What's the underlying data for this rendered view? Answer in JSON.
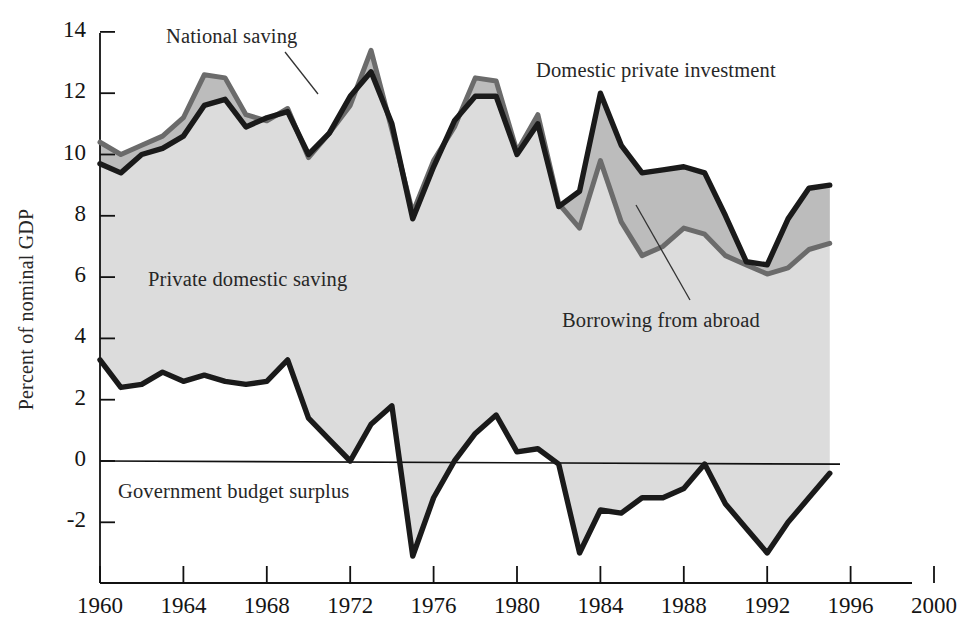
{
  "chart_data": {
    "type": "area",
    "title": "",
    "xlabel": "",
    "ylabel": "Percent of nominal GDP",
    "xlim": [
      1960,
      2000
    ],
    "ylim": [
      -3.6,
      14
    ],
    "grid": false,
    "legend_position": "inline-annotations",
    "x_ticks": [
      "1960",
      "1964",
      "1968",
      "1972",
      "1976",
      "1980",
      "1984",
      "1988",
      "1992",
      "1996",
      "2000"
    ],
    "y_ticks": [
      "14",
      "12",
      "10",
      "8",
      "6",
      "4",
      "2",
      "0",
      "-2"
    ],
    "x": [
      1960,
      1961,
      1962,
      1963,
      1964,
      1965,
      1966,
      1967,
      1968,
      1969,
      1970,
      1971,
      1972,
      1973,
      1974,
      1975,
      1976,
      1977,
      1978,
      1979,
      1980,
      1981,
      1982,
      1983,
      1984,
      1985,
      1986,
      1987,
      1988,
      1989,
      1990,
      1991,
      1992,
      1993,
      1994,
      1995
    ],
    "series": [
      {
        "name": "Domestic private investment",
        "color": "#1a1a1a",
        "values": [
          9.7,
          9.4,
          10.0,
          10.2,
          10.6,
          11.6,
          11.8,
          10.9,
          11.2,
          11.4,
          10.0,
          10.7,
          11.9,
          12.7,
          11.0,
          7.9,
          9.6,
          11.1,
          11.9,
          11.9,
          10.0,
          11.0,
          8.3,
          8.8,
          12.0,
          10.3,
          9.4,
          9.5,
          9.6,
          9.4,
          8.0,
          6.5,
          6.4,
          7.9,
          8.9,
          9.0
        ]
      },
      {
        "name": "National saving",
        "color": "#6b6b6b",
        "values": [
          10.4,
          10.0,
          10.3,
          10.6,
          11.2,
          12.6,
          12.5,
          11.3,
          11.1,
          11.5,
          9.9,
          10.7,
          11.6,
          13.4,
          10.8,
          8.1,
          9.8,
          10.9,
          12.5,
          12.4,
          10.1,
          11.3,
          8.4,
          7.6,
          9.8,
          7.8,
          6.7,
          7.0,
          7.6,
          7.4,
          6.7,
          6.4,
          6.1,
          6.3,
          6.9,
          7.1
        ]
      },
      {
        "name": "Government budget surplus",
        "color": "#1a1a1a",
        "values": [
          3.3,
          2.4,
          2.5,
          2.9,
          2.6,
          2.8,
          2.6,
          2.5,
          2.6,
          3.3,
          1.4,
          0.7,
          0.0,
          1.2,
          1.8,
          -3.1,
          -1.2,
          0.0,
          0.9,
          1.5,
          0.3,
          0.4,
          -0.1,
          -3.0,
          -1.6,
          -1.7,
          -1.2,
          -1.2,
          -0.9,
          -0.1,
          -1.4,
          -2.2,
          -3.0,
          -2.0,
          -1.2,
          -0.4
        ]
      }
    ],
    "bands": [
      {
        "name": "Private domestic saving",
        "fill": "#dcdcdc",
        "between": [
          "Government budget surplus",
          "Domestic private investment"
        ]
      },
      {
        "name": "Borrowing from abroad",
        "fill": "#bcbcbc",
        "between": [
          "National saving",
          "Domestic private investment"
        ]
      }
    ],
    "annotations": [
      {
        "name": "national-saving",
        "text": "National saving",
        "x": 166,
        "y": 25,
        "leader": [
          [
            285,
            52
          ],
          [
            318,
            94
          ]
        ]
      },
      {
        "name": "domestic-private-investment",
        "text": "Domestic private investment",
        "x": 536,
        "y": 59,
        "leader": null
      },
      {
        "name": "private-domestic-saving",
        "text": "Private domestic saving",
        "x": 148,
        "y": 268,
        "leader": null
      },
      {
        "name": "borrowing-from-abroad",
        "text": "Borrowing from abroad",
        "x": 562,
        "y": 309,
        "leader": [
          [
            636,
            205
          ],
          [
            690,
            300
          ]
        ]
      },
      {
        "name": "government-budget-surplus",
        "text": "Government budget surplus",
        "x": 118,
        "y": 480,
        "leader": null
      }
    ]
  }
}
